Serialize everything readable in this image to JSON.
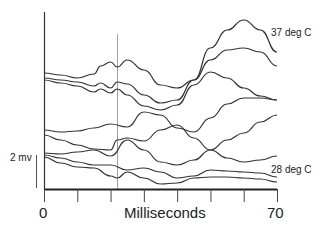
{
  "chart_data": {
    "type": "line",
    "title": "",
    "xlabel": "Milliseconds",
    "ylabel": "",
    "xlim": [
      0,
      70
    ],
    "x_tick_labels": [
      "0",
      "70"
    ],
    "x_ticks": [
      0,
      10,
      20,
      30,
      40,
      50,
      60,
      70
    ],
    "grid": false,
    "legend": null,
    "scale_bar": {
      "label": "2 mv",
      "value_mv": 2
    },
    "marker_line_x": 20,
    "annotations": [
      {
        "text": "37 deg C",
        "attached_to": "top trace"
      },
      {
        "text": "28 deg C",
        "attached_to": "bottom trace"
      }
    ],
    "series": [
      {
        "name": "trace-1 (37 deg C)",
        "x": [
          0,
          5,
          10,
          15,
          17,
          20,
          22,
          25,
          30,
          35,
          40,
          45,
          50,
          55,
          60,
          65,
          70
        ],
        "y_px": [
          73,
          75,
          78,
          74,
          66,
          62,
          67,
          60,
          70,
          85,
          88,
          80,
          48,
          30,
          20,
          30,
          52
        ]
      },
      {
        "name": "trace-2",
        "x": [
          0,
          5,
          10,
          15,
          17,
          20,
          22,
          25,
          30,
          35,
          40,
          45,
          50,
          55,
          60,
          65,
          70
        ],
        "y_px": [
          78,
          80,
          82,
          86,
          83,
          88,
          82,
          84,
          95,
          103,
          100,
          80,
          60,
          50,
          48,
          52,
          66
        ]
      },
      {
        "name": "trace-3",
        "x": [
          0,
          5,
          10,
          15,
          17,
          20,
          22,
          25,
          30,
          35,
          40,
          45,
          50,
          55,
          60,
          65,
          70
        ],
        "y_px": [
          80,
          83,
          86,
          92,
          89,
          93,
          89,
          95,
          106,
          110,
          105,
          85,
          72,
          78,
          88,
          96,
          100
        ]
      },
      {
        "name": "trace-4",
        "x": [
          0,
          5,
          10,
          15,
          20,
          25,
          30,
          35,
          40,
          45,
          50,
          55,
          60,
          65,
          70
        ],
        "y_px": [
          130,
          132,
          131,
          128,
          124,
          127,
          112,
          115,
          128,
          132,
          118,
          104,
          98,
          98,
          100
        ]
      },
      {
        "name": "trace-5",
        "x": [
          0,
          5,
          10,
          15,
          20,
          22,
          25,
          30,
          35,
          40,
          45,
          50,
          55,
          60,
          65,
          70
        ],
        "y_px": [
          135,
          140,
          145,
          149,
          150,
          140,
          138,
          141,
          130,
          125,
          138,
          150,
          158,
          162,
          160,
          156
        ]
      },
      {
        "name": "trace-6",
        "x": [
          0,
          5,
          10,
          15,
          20,
          25,
          30,
          35,
          40,
          45,
          50,
          55,
          60,
          65,
          70
        ],
        "y_px": [
          153,
          154,
          152,
          150,
          156,
          140,
          150,
          162,
          165,
          160,
          150,
          140,
          133,
          122,
          115
        ]
      },
      {
        "name": "trace-7 (28 deg C)",
        "x": [
          0,
          5,
          10,
          15,
          20,
          25,
          30,
          35,
          40,
          45,
          50,
          55,
          60,
          65,
          70
        ],
        "y_px": [
          155,
          158,
          162,
          165,
          165,
          170,
          168,
          172,
          178,
          176,
          170,
          171,
          172,
          173,
          177
        ]
      },
      {
        "name": "trace-8",
        "x": [
          0,
          5,
          10,
          15,
          20,
          22,
          25,
          30,
          35,
          40,
          45,
          50,
          55,
          60,
          65,
          70
        ],
        "y_px": [
          157,
          163,
          167,
          168,
          176,
          178,
          172,
          178,
          184,
          183,
          178,
          177,
          177,
          178,
          179,
          182
        ]
      }
    ]
  },
  "labels": {
    "top_series": "37 deg C",
    "bottom_series": "28 deg C",
    "scale_bar": "2 mv",
    "x_start": "0",
    "x_end": "70",
    "x_title": "Milliseconds"
  }
}
